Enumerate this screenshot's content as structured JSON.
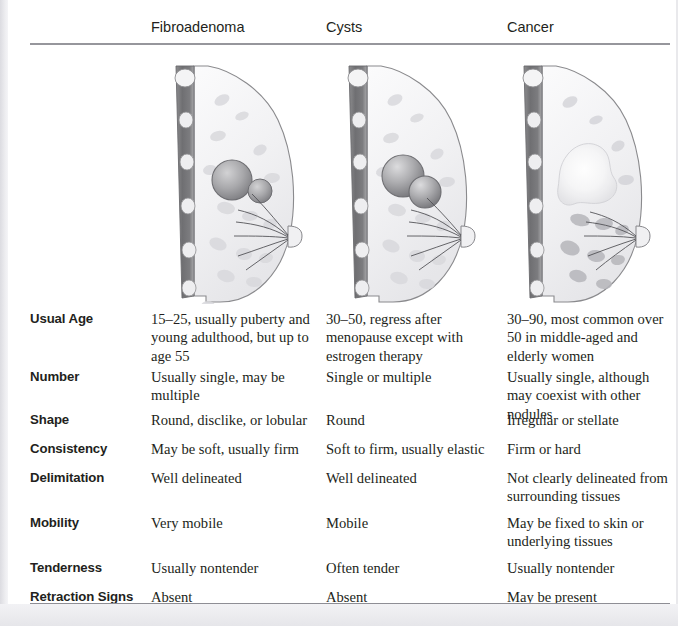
{
  "table": {
    "columns": [
      {
        "label": "Fibroadenoma",
        "icon": "breast-cross-section-fibroadenoma"
      },
      {
        "label": "Cysts",
        "icon": "breast-cross-section-cysts"
      },
      {
        "label": "Cancer",
        "icon": "breast-cross-section-cancer"
      }
    ],
    "rows": [
      {
        "label": "Usual Age",
        "fibroadenoma": "15–25, usually puberty and young adulthood, but up to age 55",
        "cysts": "30–50, regress after menopause except with estrogen therapy",
        "cancer": "30–90, most common over 50 in middle-aged and elderly women"
      },
      {
        "label": "Number",
        "fibroadenoma": "Usually single, may be multiple",
        "cysts": "Single or multiple",
        "cancer": "Usually single, although may coexist with other nodules"
      },
      {
        "label": "Shape",
        "fibroadenoma": "Round, disclike, or lobular",
        "cysts": "Round",
        "cancer": "Irregular or stellate"
      },
      {
        "label": "Consistency",
        "fibroadenoma": "May be soft, usually firm",
        "cysts": "Soft to firm, usually elastic",
        "cancer": "Firm or hard"
      },
      {
        "label": "Delimitation",
        "fibroadenoma": "Well delineated",
        "cysts": "Well delineated",
        "cancer": "Not clearly delineated from surrounding tissues"
      },
      {
        "label": "Mobility",
        "fibroadenoma": "Very mobile",
        "cysts": "Mobile",
        "cancer": "May be fixed to skin or underlying tissues"
      },
      {
        "label": "Tenderness",
        "fibroadenoma": "Usually nontender",
        "cysts": "Often tender",
        "cancer": "Usually nontender"
      },
      {
        "label": "Retraction Signs",
        "fibroadenoma": "Absent",
        "cysts": "Absent",
        "cancer": "May be present"
      }
    ]
  },
  "colors": {
    "rule": "#96969c",
    "text": "#231f20",
    "page_background": "#e9e9ec",
    "sheet": "#ffffff"
  }
}
